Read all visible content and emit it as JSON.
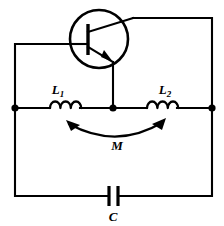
{
  "diagram": {
    "type": "schematic",
    "background_color": "#ffffff",
    "line_color": "#000000",
    "components": {
      "transistor": {
        "name": "transistor",
        "symbol": "npn-bjt",
        "label": ""
      },
      "inductor_left": {
        "name": "inductor-l1",
        "label": "L",
        "subscript": "1",
        "coil_turns": 3
      },
      "inductor_right": {
        "name": "inductor-l2",
        "label": "L",
        "subscript": "2",
        "coil_turns": 3
      },
      "mutual_inductance": {
        "name": "mutual-inductance",
        "label": "M",
        "arrow": "double-headed-arc"
      },
      "capacitor": {
        "name": "capacitor-c",
        "label": "C",
        "plates": 2
      }
    },
    "nodes": [
      {
        "name": "node-left",
        "x": 15,
        "y": 108
      },
      {
        "name": "node-center",
        "x": 113,
        "y": 108
      },
      {
        "name": "node-right",
        "x": 212,
        "y": 108
      }
    ]
  }
}
